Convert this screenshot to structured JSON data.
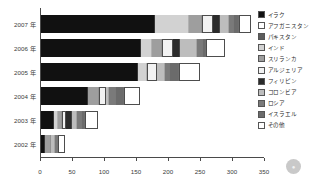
{
  "chart_data": {
    "type": "bar",
    "orientation": "horizontal",
    "stacked": true,
    "title": "",
    "xlabel": "",
    "ylabel": "",
    "xlim": [
      0,
      350
    ],
    "xticks": [
      0,
      50,
      100,
      150,
      200,
      250,
      300,
      350
    ],
    "xtick_labels": [
      "0",
      "50",
      "100",
      "150",
      "200",
      "250",
      "300",
      "350"
    ],
    "grid": false,
    "legend_position": "right",
    "categories": [
      "2007 年",
      "2006 年",
      "2005 年",
      "2004 年",
      "2003 年",
      "2002 年"
    ],
    "series": [
      {
        "name": "イラク",
        "color": "#111111",
        "values": [
          178,
          156,
          152,
          74,
          20,
          6
        ]
      },
      {
        "name": "アフガニスタン",
        "color": "#ffffff",
        "values": [
          0,
          0,
          0,
          0,
          0,
          0
        ]
      },
      {
        "name": "パキスタン",
        "color": "#5c5c5c",
        "values": [
          0,
          0,
          0,
          0,
          0,
          0
        ]
      },
      {
        "name": "インド",
        "color": "#d2d2d2",
        "values": [
          53,
          18,
          14,
          0,
          6,
          0
        ]
      },
      {
        "name": "スリランカ",
        "color": "#9e9e9e",
        "values": [
          21,
          15,
          0,
          17,
          7,
          10
        ]
      },
      {
        "name": "アルジェリア",
        "color": "#f2f2f2",
        "values": [
          17,
          17,
          16,
          10,
          6,
          0
        ]
      },
      {
        "name": "フィリピン",
        "color": "#2b2b2b",
        "values": [
          11,
          12,
          0,
          0,
          9,
          0
        ]
      },
      {
        "name": "コロンビア",
        "color": "#bdbdbd",
        "values": [
          14,
          26,
          12,
          6,
          9,
          6
        ]
      },
      {
        "name": "ロシア",
        "color": "#7a7a7a",
        "values": [
          8,
          9,
          8,
          11,
          7,
          5
        ]
      },
      {
        "name": "イスラエル",
        "color": "#6b6b6b",
        "values": [
          7,
          5,
          14,
          11,
          5,
          0
        ]
      },
      {
        "name": "その他",
        "color": "#ffffff",
        "values": [
          19,
          29,
          32,
          26,
          20,
          10
        ]
      }
    ]
  },
  "watermark": {
    "glyph": "●"
  }
}
